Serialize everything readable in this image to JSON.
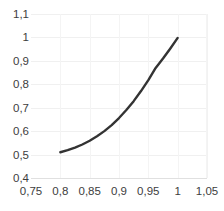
{
  "chart_data": {
    "type": "line",
    "title": "",
    "subtitle": "",
    "xlabel": "",
    "ylabel": "",
    "xlim": [
      0.75,
      1.05
    ],
    "ylim": [
      0.4,
      1.1
    ],
    "grid": true,
    "legend": false,
    "legend_position": "none",
    "line_color": "#333333",
    "line_width": 2.4,
    "markers": false,
    "x_ticks": [
      "0,75",
      "0,8",
      "0,85",
      "0,9",
      "0,95",
      "1",
      "1,05"
    ],
    "x_tick_values": [
      0.75,
      0.8,
      0.85,
      0.9,
      0.95,
      1.0,
      1.05
    ],
    "y_ticks": [
      "0,4",
      "0,5",
      "0,6",
      "0,7",
      "0,8",
      "0,9",
      "1",
      "1,1"
    ],
    "y_tick_values": [
      0.4,
      0.5,
      0.6,
      0.7,
      0.8,
      0.9,
      1.0,
      1.1
    ],
    "x": [
      0.8,
      0.8125,
      0.825,
      0.8375,
      0.85,
      0.8625,
      0.875,
      0.8875,
      0.9,
      0.9125,
      0.925,
      0.9375,
      0.95,
      0.9625,
      0.975,
      0.9875,
      1.0
    ],
    "values": [
      0.51,
      0.519,
      0.53,
      0.543,
      0.559,
      0.578,
      0.6,
      0.626,
      0.656,
      0.69,
      0.728,
      0.771,
      0.818,
      0.87,
      0.91,
      0.953,
      0.998
    ],
    "series": [
      {
        "name": "curve",
        "values": [
          0.51,
          0.519,
          0.53,
          0.543,
          0.559,
          0.578,
          0.6,
          0.626,
          0.656,
          0.69,
          0.728,
          0.771,
          0.818,
          0.87,
          0.91,
          0.953,
          0.998
        ]
      }
    ],
    "annotations": [],
    "decimal_separator": ","
  },
  "colors": {
    "background": "#ffffff",
    "grid": "#f0f0f0",
    "axis": "#e0e0e0",
    "tick_text": "#3d3d3d",
    "curve": "#333333"
  }
}
